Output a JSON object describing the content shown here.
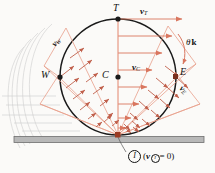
{
  "figure": {
    "colors": {
      "vector": "#d9765f",
      "vector_light": "#e8a08c",
      "circle": "#1a1a1a",
      "ground_fill": "#b8b8b8",
      "ground_stroke": "#6e6e6e",
      "ghost": "#c9c9c9",
      "text": "#111111",
      "background": "#fbfaf8"
    },
    "geometry": {
      "center_x": 118,
      "center_y": 77,
      "radius": 58,
      "contact_x": 118,
      "contact_y": 135,
      "ground_y": 137
    }
  },
  "points": [
    {
      "id": "T",
      "label": "T",
      "x": 118,
      "y": 19,
      "role": "top-point"
    },
    {
      "id": "C",
      "label": "C",
      "x": 118,
      "y": 77,
      "role": "center-point"
    },
    {
      "id": "W",
      "label": "W",
      "x": 60,
      "y": 77,
      "role": "west-point"
    },
    {
      "id": "E",
      "label": "E",
      "x": 176,
      "y": 77,
      "role": "east-point"
    },
    {
      "id": "I",
      "label": "I",
      "x": 118,
      "y": 135,
      "role": "contact-point"
    }
  ],
  "vector_labels": [
    {
      "id": "vT",
      "symbol": "v",
      "sub": "T",
      "x": 141,
      "y": 13,
      "rotate": 0
    },
    {
      "id": "vC",
      "symbol": "v",
      "sub": "C",
      "x": 133,
      "y": 69,
      "rotate": 0
    },
    {
      "id": "vW",
      "symbol": "v",
      "sub": "W",
      "x": 52,
      "y": 46,
      "rotate": -45
    },
    {
      "id": "vE",
      "symbol": "v",
      "sub": "E",
      "x": 182,
      "y": 90,
      "rotate": 45
    }
  ],
  "annotations": {
    "omega": {
      "symbol": "θ̇",
      "unit": "k",
      "text": "θ̇ k",
      "x": 180,
      "y": 44
    },
    "contact": {
      "circle_label": "I",
      "expression_open": "(",
      "expression_v": "v",
      "expression_sub": "I",
      "expression_rest": " = 0)",
      "x": 128,
      "y": 157
    }
  },
  "vector_field": {
    "description": "Velocity arrows perpendicular to radial lines from contact point I, magnitude proportional to distance from I.",
    "radial_line_angles_deg": [
      90,
      110,
      130,
      150,
      170,
      70,
      50,
      30,
      10
    ],
    "horizontal_arrow_rows": 7
  }
}
